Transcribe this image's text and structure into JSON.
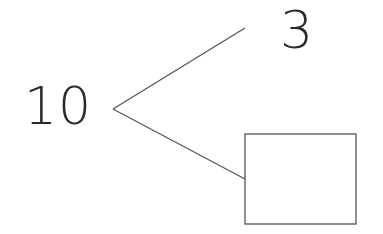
{
  "diagram": {
    "type": "number-bond",
    "whole": "10",
    "parts": [
      {
        "label": "3",
        "position": "top"
      },
      {
        "label": "",
        "position": "bottom",
        "is_blank_box": true
      }
    ],
    "colors": {
      "stroke": "#555555",
      "text": "#2a2a2a"
    }
  }
}
